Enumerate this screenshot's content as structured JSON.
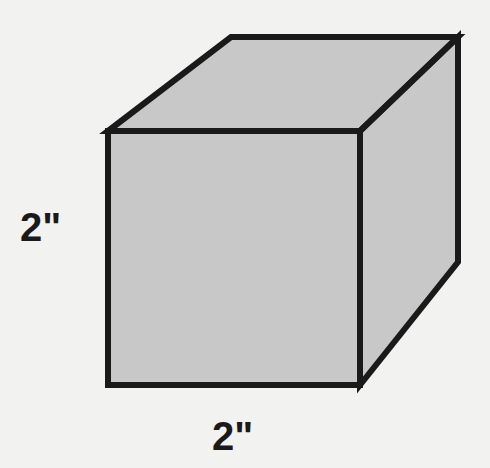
{
  "figure": {
    "name": "cube-diagram",
    "background_color": "#f2f2f0",
    "face_fill_color": "#c8c8c8",
    "edge_color": "#1a1a1a",
    "label_color": "#1a1a1a",
    "edge_stroke_width": 6
  },
  "labels": {
    "height": "2\"",
    "width": "2\""
  },
  "shape": {
    "type": "cube",
    "faces": {
      "front": "108,131 360,131 360,385 108,385",
      "top": "108,131 231,37 458,37 360,131",
      "right": "360,131 458,37 458,262 360,385"
    }
  }
}
